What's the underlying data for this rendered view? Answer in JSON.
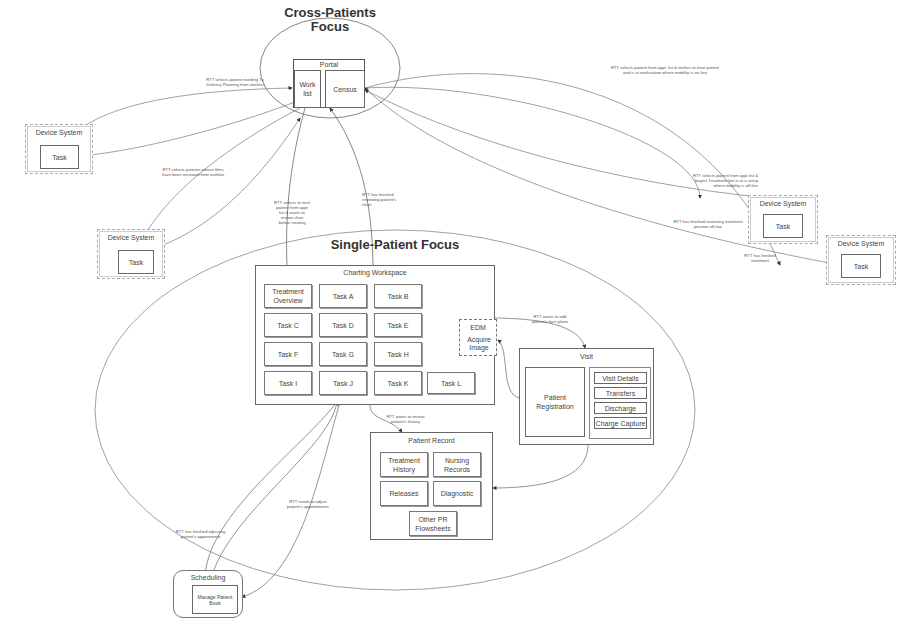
{
  "cross_patients": {
    "title_line1": "Cross-Patients",
    "title_line2": "Focus",
    "portal": {
      "label": "Portal",
      "worklist": "Work list",
      "census": "Census"
    }
  },
  "single_patient": {
    "title": "Single-Patient Focus",
    "charting_workspace": {
      "label": "Charting Workspace",
      "tasks": [
        "Treatment Overview",
        "Task A",
        "Task B",
        "Task C",
        "Task D",
        "Task E",
        "Task F",
        "Task G",
        "Task H",
        "Task I",
        "Task J",
        "Task K",
        "Task L"
      ]
    },
    "edm": {
      "label": "EDM",
      "action": "Acquire Image"
    },
    "visit": {
      "label": "Visit",
      "patient_registration": "Patient Registration",
      "items": [
        "Visit Details",
        "Transfers",
        "Discharge",
        "Charge Capture"
      ]
    },
    "patient_record": {
      "label": "Patient Record",
      "items": [
        "Treatment History",
        "Nursing Records",
        "Releases",
        "Diagnostic",
        "Other PR Flowsheets"
      ]
    }
  },
  "device_systems": [
    {
      "label": "Device System",
      "task": "Task"
    },
    {
      "label": "Device System",
      "task": "Task"
    },
    {
      "label": "Device System",
      "task": "Task"
    },
    {
      "label": "Device System",
      "task": "Task"
    }
  ],
  "scheduling": {
    "label": "Scheduling",
    "task": "Manage Patient Book"
  },
  "notes": {
    "n1": "RTT selects patient needing Tx\nDelivery Planning from worklist",
    "n2": "RTT selects patients whose films\nhave been reviewed from worklist",
    "n3": "RTT selects to next\npatient from appt\nlist & wants to\nreview chart\nbefore treating",
    "n4": "RTT has finished\nreviewing patient's\nchart",
    "n5": "RTT selects patient from appt. list & wishes to treat patient\nand is at workstation where mobility is on-line",
    "n6": "RTT selects patient from appt list &\nbegins Treatment but is at a setup\nwhere mobility is off-line",
    "n7": "RTT has finished reviewing treatment\nposition off-line",
    "n8": "RTT has finished\ntreatment",
    "n9": "RTT wants to add\npatient's face photo",
    "n10": "RTT wants to review\npatient's history",
    "n11": "RTT needs to adjust\npatient's appointments",
    "n12": "RTT has finished adjusting\npatient's appointment"
  }
}
